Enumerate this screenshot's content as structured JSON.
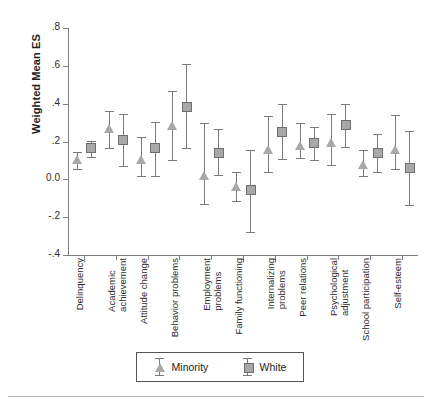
{
  "chart_data": {
    "type": "scatter",
    "title": "",
    "xlabel": "",
    "ylabel": "Weighted Mean ES",
    "ylim": [
      -0.4,
      0.8
    ],
    "ytick_labels": [
      ".8",
      ".6",
      ".4",
      ".2",
      "0.0",
      "-.2",
      "-.4"
    ],
    "ytick_values": [
      0.8,
      0.6,
      0.4,
      0.2,
      0.0,
      -0.2,
      -0.4
    ],
    "grid": false,
    "legend_position": "bottom",
    "error_bars": "95% CI",
    "categories": [
      "Delinquency",
      "Academic achievement",
      "Attitude change",
      "Behavior problems",
      "Employment problems",
      "Family functioning",
      "Internalizing problems",
      "Peer relations",
      "Psychological adjustment",
      "School participation",
      "Self-esteem"
    ],
    "series": [
      {
        "name": "Minority",
        "marker": "triangle",
        "values": [
          0.1,
          0.265,
          0.1,
          0.28,
          0.015,
          -0.04,
          0.155,
          0.175,
          0.19,
          0.075,
          0.155
        ],
        "ci_low": [
          0.055,
          0.165,
          0.02,
          0.1,
          -0.13,
          -0.115,
          0.04,
          0.115,
          0.075,
          0.02,
          0.055
        ],
        "ci_high": [
          0.145,
          0.36,
          0.225,
          0.465,
          0.3,
          0.04,
          0.335,
          0.3,
          0.345,
          0.155,
          0.34
        ]
      },
      {
        "name": "White",
        "marker": "square",
        "values": [
          0.165,
          0.21,
          0.165,
          0.385,
          0.14,
          -0.055,
          0.25,
          0.19,
          0.285,
          0.14,
          0.06
        ],
        "ci_low": [
          0.12,
          0.07,
          0.02,
          0.165,
          0.025,
          -0.28,
          0.105,
          0.1,
          0.17,
          0.04,
          -0.135
        ],
        "ci_high": [
          0.205,
          0.345,
          0.305,
          0.61,
          0.265,
          0.155,
          0.4,
          0.275,
          0.4,
          0.24,
          0.255
        ]
      }
    ]
  },
  "legend": {
    "items": [
      {
        "label": "Minority",
        "glyph": "triangle-marker-icon"
      },
      {
        "label": "White",
        "glyph": "square-marker-icon"
      }
    ]
  }
}
